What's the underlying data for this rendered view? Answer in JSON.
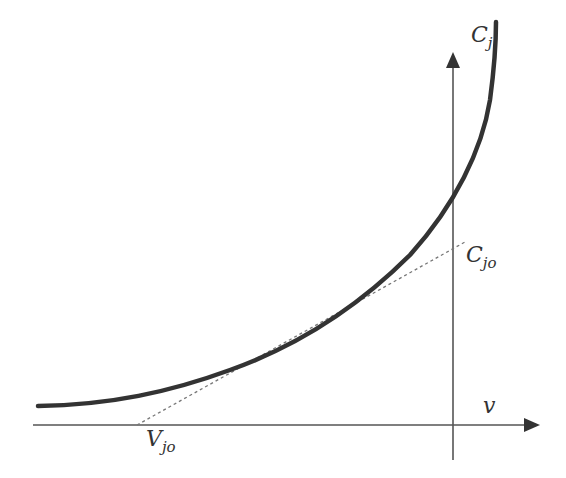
{
  "diagram": {
    "colors": {
      "background": "#ffffff",
      "curve": "#333333",
      "axes": "#555555",
      "tangent": "#777777",
      "text": "#333333"
    },
    "axes": {
      "x_label": {
        "main": "v",
        "sub": ""
      },
      "y_label": {
        "main": "C",
        "sub": "j"
      }
    },
    "annotations": {
      "intercept_y": {
        "main": "C",
        "sub": "jo"
      },
      "intercept_x": {
        "main": "V",
        "sub": "jo"
      }
    },
    "elements": {
      "curve": "C_j(v) capacitance curve (thick, rising steeply near origin)",
      "tangent_line": "dashed tangent line from V_jo on x-axis to C_jo on y-axis"
    }
  }
}
